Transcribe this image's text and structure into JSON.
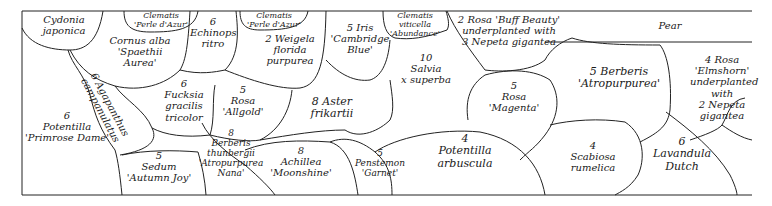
{
  "plan": {
    "type": "planting-plan",
    "beds": [
      {
        "id": "cydonia",
        "lines": [
          "Cydonia",
          "japonica"
        ]
      },
      {
        "id": "clematis-1",
        "lines": [
          "Clematis",
          "'Perle d'Azur'"
        ]
      },
      {
        "id": "cornus",
        "lines": [
          "Cornus alba",
          "'Spaethii",
          "Aurea'"
        ]
      },
      {
        "id": "echinops",
        "lines": [
          "6",
          "Echinops",
          "ritro"
        ]
      },
      {
        "id": "clematis-2",
        "lines": [
          "Clematis",
          "'Perle d'Azur'"
        ]
      },
      {
        "id": "weigela",
        "lines": [
          "2 Weigela",
          "florida",
          "purpurea"
        ]
      },
      {
        "id": "iris",
        "lines": [
          "5 Iris",
          "'Cambridge",
          "Blue'"
        ]
      },
      {
        "id": "clematis-3",
        "lines": [
          "Clematis",
          "viticella",
          "'Abundance'"
        ]
      },
      {
        "id": "rosa-buff",
        "lines": [
          "2 Rosa 'Buff Beauty'",
          "underplanted with",
          "3 Nepeta gigantea"
        ]
      },
      {
        "id": "pear",
        "lines": [
          "Pear"
        ]
      },
      {
        "id": "agapanthus",
        "lines": [
          "6 Agapanthus",
          "campanulatus"
        ]
      },
      {
        "id": "fuchsia",
        "lines": [
          "6",
          "Fucksia",
          "gracilis",
          "tricolor"
        ]
      },
      {
        "id": "rosa-allgold",
        "lines": [
          "5",
          "Rosa",
          "'Allgold'"
        ]
      },
      {
        "id": "aster",
        "lines": [
          "8 Aster",
          "frikartii"
        ]
      },
      {
        "id": "salvia",
        "lines": [
          "10",
          "Salvia",
          "x superba"
        ]
      },
      {
        "id": "rosa-magenta",
        "lines": [
          "5",
          "Rosa",
          "'Magenta'"
        ]
      },
      {
        "id": "berberis-atro",
        "lines": [
          "5 Berberis",
          "'Atropurpurea'"
        ]
      },
      {
        "id": "rosa-elmshorn",
        "lines": [
          "4 Rosa",
          "'Elmshorn'",
          "underplanted",
          "with",
          "2 Nepeta",
          "gigantea"
        ]
      },
      {
        "id": "potentilla-primrose",
        "lines": [
          "6",
          "Potentilla",
          "'Primrose Dame'"
        ]
      },
      {
        "id": "sedum",
        "lines": [
          "5",
          "Sedum",
          "'Autumn Joy'"
        ]
      },
      {
        "id": "berberis-thunbergii",
        "lines": [
          "8",
          "Berberis",
          "thunbergii",
          "'Atropurpurea",
          "Nana'"
        ]
      },
      {
        "id": "achillea",
        "lines": [
          "8",
          "Achillea",
          "'Moonshine'"
        ]
      },
      {
        "id": "penstemon",
        "lines": [
          "5",
          "Penstemon",
          "'Garnet'"
        ]
      },
      {
        "id": "potentilla-arbuscula",
        "lines": [
          "4",
          "Potentilla",
          "arbuscula"
        ]
      },
      {
        "id": "scabiosa",
        "lines": [
          "4",
          "Scabiosa",
          "rumelica"
        ]
      },
      {
        "id": "lavandula",
        "lines": [
          "6",
          "Lavandula",
          "Dutch"
        ]
      }
    ]
  }
}
